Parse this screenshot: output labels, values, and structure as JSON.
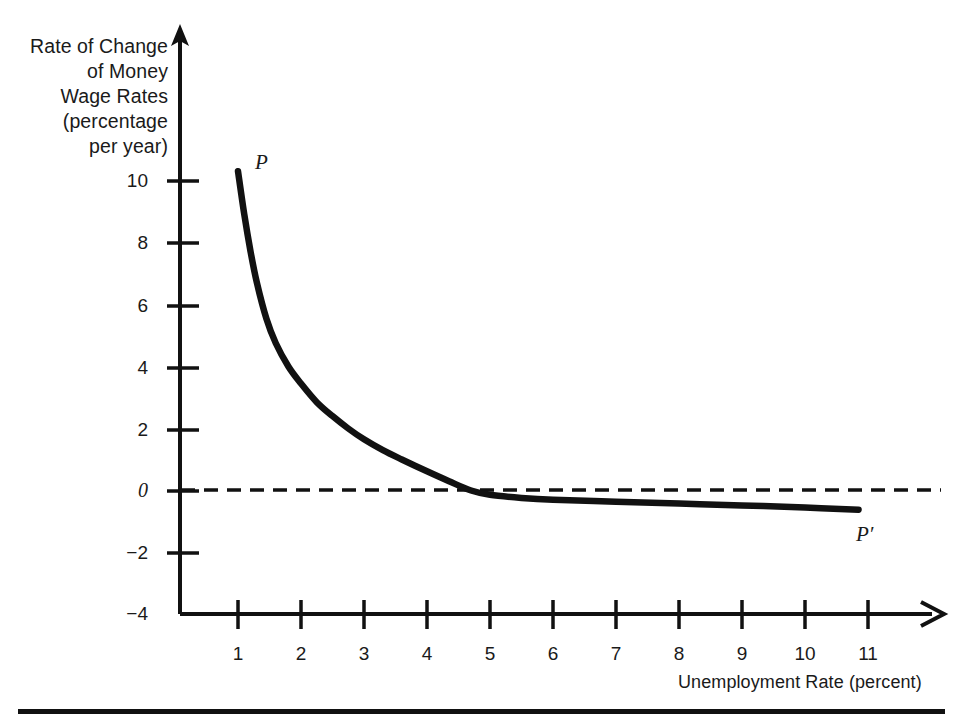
{
  "figure": {
    "y_axis_title_lines": [
      "Rate of Change",
      "of Money",
      "Wage Rates",
      "(percentage",
      "per year)"
    ],
    "x_axis_title": "Unemployment Rate (percent)",
    "curve_label_start": "P",
    "curve_label_end": "P′",
    "line_color": "#111111",
    "text_color": "#1a1a1a",
    "background_color": "#ffffff"
  },
  "y_ticks": [
    {
      "label": "10",
      "value": 10
    },
    {
      "label": "8",
      "value": 8
    },
    {
      "label": "6",
      "value": 6
    },
    {
      "label": "4",
      "value": 4
    },
    {
      "label": "2",
      "value": 2
    },
    {
      "label": "0",
      "value": 0
    },
    {
      "label": "−2",
      "value": -2
    },
    {
      "label": "−4",
      "value": -4
    }
  ],
  "x_ticks": [
    {
      "label": "1",
      "value": 1
    },
    {
      "label": "2",
      "value": 2
    },
    {
      "label": "3",
      "value": 3
    },
    {
      "label": "4",
      "value": 4
    },
    {
      "label": "5",
      "value": 5
    },
    {
      "label": "6",
      "value": 6
    },
    {
      "label": "7",
      "value": 7
    },
    {
      "label": "8",
      "value": 8
    },
    {
      "label": "9",
      "value": 9
    },
    {
      "label": "10",
      "value": 10
    },
    {
      "label": "11",
      "value": 11
    }
  ],
  "chart_data": {
    "type": "line",
    "title": "",
    "subtitle": "",
    "xlabel": "Unemployment Rate (percent)",
    "ylabel": "Rate of Change of Money Wage Rates (percentage per year)",
    "xlim": [
      0.55,
      11.6
    ],
    "ylim": [
      -4,
      11.2
    ],
    "grid": false,
    "legend": "none",
    "annotations": [
      {
        "text": "P",
        "x": 1.25,
        "y": 10.6,
        "note": "label at upper start of curve"
      },
      {
        "text": "P′",
        "x": 11.0,
        "y": -1.25,
        "note": "label at lower right end of curve"
      },
      {
        "text": "zero-line",
        "type": "dashed-horizontal",
        "y": 0,
        "x_start": 1.0,
        "x_end": 12.05
      }
    ],
    "series": [
      {
        "name": "Phillips curve PP′",
        "style": "solid-thick",
        "color": "#111111",
        "x": [
          1.0,
          1.1,
          1.2,
          1.3,
          1.45,
          1.6,
          1.8,
          2.0,
          2.25,
          2.5,
          2.75,
          3.0,
          3.3,
          3.6,
          4.0,
          4.35,
          4.7,
          5.0,
          5.5,
          6.0,
          7.0,
          8.0,
          9.0,
          10.0,
          10.85
        ],
        "y": [
          10.3,
          8.9,
          7.7,
          6.7,
          5.55,
          4.75,
          4.0,
          3.45,
          2.85,
          2.4,
          2.0,
          1.65,
          1.3,
          1.0,
          0.62,
          0.3,
          0.0,
          -0.14,
          -0.24,
          -0.3,
          -0.36,
          -0.42,
          -0.48,
          -0.55,
          -0.62
        ]
      }
    ],
    "key_points": [
      {
        "label": "curve start",
        "x": 1.0,
        "y": 10.3
      },
      {
        "label": "zero crossing (natural rate)",
        "x": 4.7,
        "y": 0.0
      },
      {
        "label": "curve end",
        "x": 10.85,
        "y": -0.62
      }
    ]
  }
}
